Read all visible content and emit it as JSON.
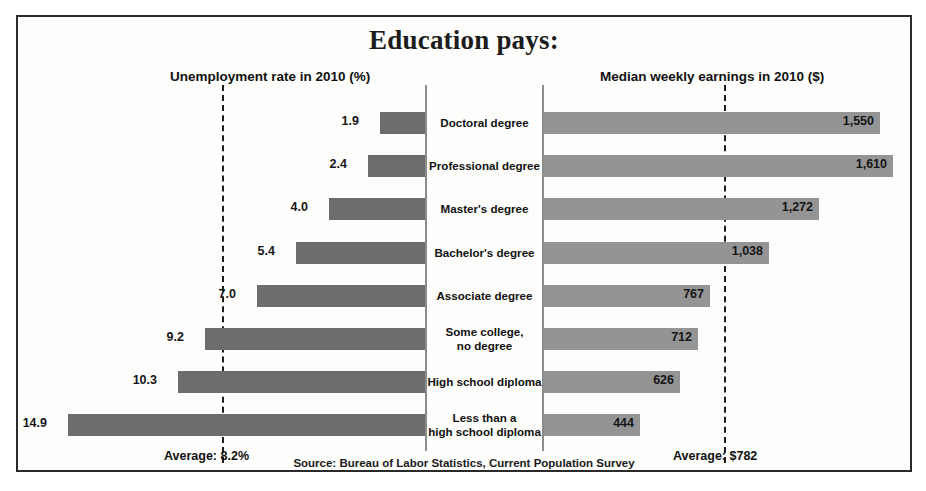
{
  "chart_data": {
    "type": "bar",
    "title": "Education pays:",
    "subtitle": "",
    "orientation": "horizontal-diverging",
    "categories": [
      "Doctoral degree",
      "Professional degree",
      "Master's degree",
      "Bachelor's degree",
      "Associate degree",
      "Some college,\nno degree",
      "High school diploma",
      "Less than a\nhigh school diploma"
    ],
    "series": [
      {
        "name": "Unemployment rate in 2010 (%)",
        "side": "left",
        "unit": "%",
        "values": [
          1.9,
          2.4,
          4.0,
          5.4,
          7.0,
          9.2,
          10.3,
          14.9
        ],
        "labels": [
          "1.9",
          "2.4",
          "4.0",
          "5.4",
          "7.0",
          "9.2",
          "10.3",
          "14.9"
        ],
        "color": "#6d6d6d",
        "average": 8.2,
        "average_label": "Average: 8.2%",
        "axis_max": 16.0
      },
      {
        "name": "Median weekly earnings in 2010 ($)",
        "side": "right",
        "unit": "$",
        "values": [
          1550,
          1610,
          1272,
          1038,
          767,
          712,
          626,
          444
        ],
        "labels": [
          "1,550",
          "1,610",
          "1,272",
          "1,038",
          "767",
          "712",
          "626",
          "444"
        ],
        "color": "#949494",
        "average": 782,
        "average_label": "Average: $782",
        "axis_max": 1700
      }
    ],
    "grid": false,
    "legend": "none",
    "annotations": [
      "Source: Bureau of Labor Statistics, Current Population Survey"
    ]
  },
  "chart": {
    "title": "Education pays:",
    "left_header": "Unemployment rate in 2010 (%)",
    "right_header": "Median weekly earnings in 2010 ($)",
    "left_average_label": "Average: 8.2%",
    "right_average_label": "Average: $782",
    "source": "Source: Bureau of Labor Statistics, Current Population Survey",
    "rows": [
      {
        "category": "Doctoral degree",
        "left_value": "1.9",
        "right_value": "1,550"
      },
      {
        "category": "Professional degree",
        "left_value": "2.4",
        "right_value": "1,610"
      },
      {
        "category": "Master's degree",
        "left_value": "4.0",
        "right_value": "1,272"
      },
      {
        "category": "Bachelor's degree",
        "left_value": "5.4",
        "right_value": "1,038"
      },
      {
        "category": "Associate degree",
        "left_value": "7.0",
        "right_value": "767"
      },
      {
        "category": "Some college, no degree",
        "left_value": "9.2",
        "right_value": "712"
      },
      {
        "category": "High school diploma",
        "left_value": "10.3",
        "right_value": "626"
      },
      {
        "category": "Less than a high school diploma",
        "left_value": "14.9",
        "right_value": "444"
      }
    ],
    "colors": {
      "left_bar": "#6d6d6d",
      "right_bar": "#949494",
      "frame": "#2a2a2a",
      "average_line": "#1d1d1d"
    }
  }
}
